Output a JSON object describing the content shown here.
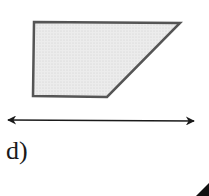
{
  "figure": {
    "label": "d)",
    "shape": {
      "type": "trapezoid",
      "fill": "#e6e6e6",
      "stroke": "#555555",
      "points": "34,22 180,23 107,97 33,96"
    },
    "line": {
      "type": "double-arrow",
      "x1": 8,
      "y1": 120,
      "x2": 194,
      "y2": 121,
      "color": "#1a1a1a"
    },
    "partial_shape": {
      "type": "cut-off-edge",
      "points": "196,196 209,183 209,196",
      "color": "#111111"
    }
  }
}
